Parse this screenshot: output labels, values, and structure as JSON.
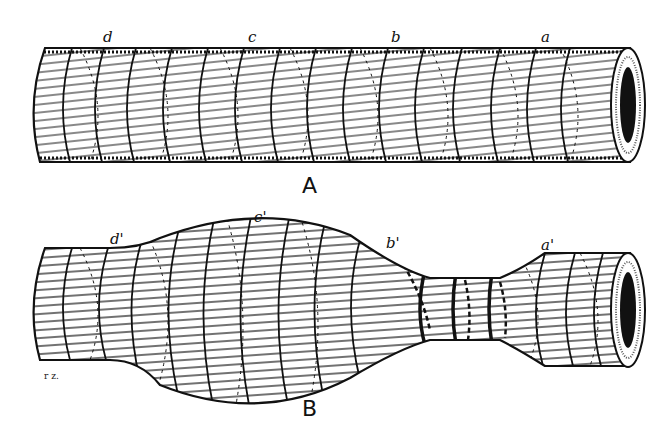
{
  "figure": {
    "panels": [
      {
        "id": "A",
        "caption": "A",
        "description": "Straight cylindrical tube with helical fibre winding",
        "markers": [
          "d",
          "c",
          "b",
          "a"
        ]
      },
      {
        "id": "B",
        "caption": "B",
        "description": "Deformed tube: bulged middle section and constricted neck",
        "markers": [
          "d'",
          "c'",
          "b'",
          "a'"
        ]
      }
    ],
    "signature": "r z.",
    "colors": {
      "ink": "#111111",
      "paper": "#ffffff"
    }
  }
}
